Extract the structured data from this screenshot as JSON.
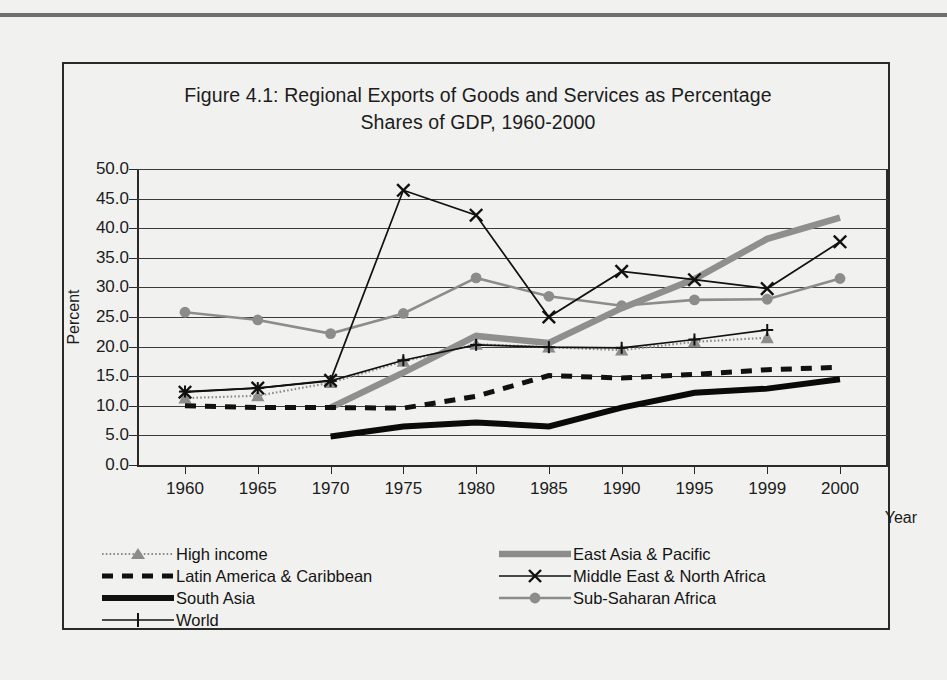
{
  "chart_data": {
    "type": "line",
    "title": "Figure 4.1: Regional Exports of Goods and Services as Percentage Shares of GDP, 1960-2000",
    "title_line1": "Figure 4.1: Regional Exports of Goods and Services as Percentage",
    "title_line2": "Shares of GDP, 1960-2000",
    "xlabel": "Year",
    "ylabel": "Percent",
    "ylim": [
      0.0,
      50.0
    ],
    "ytick_step": 5.0,
    "ytick_labels": [
      "50.0",
      "45.0",
      "40.0",
      "35.0",
      "30.0",
      "25.0",
      "20.0",
      "15.0",
      "10.0",
      "5.0",
      "0.0"
    ],
    "grid": true,
    "legend_position": "bottom",
    "categories": [
      "1960",
      "1965",
      "1970",
      "1975",
      "1980",
      "1985",
      "1990",
      "1995",
      "1999",
      "2000"
    ],
    "series": [
      {
        "name": "High income",
        "style": "dotted-gray-triangle",
        "color": "#8c8c8c",
        "marker": "triangle",
        "values": [
          11.3,
          11.7,
          13.9,
          17.5,
          20.4,
          19.9,
          19.4,
          20.8,
          21.5,
          null
        ]
      },
      {
        "name": "East Asia & Pacific",
        "style": "thick-gray",
        "color": "#8f8f8f",
        "marker": "none",
        "values": [
          null,
          null,
          9.7,
          15.6,
          21.8,
          20.6,
          26.5,
          31.4,
          38.2,
          41.8
        ]
      },
      {
        "name": "Latin America & Caribbean",
        "style": "thick-dashed-black",
        "color": "#111111",
        "marker": "none",
        "values": [
          10.0,
          9.7,
          9.7,
          9.6,
          11.6,
          15.1,
          14.7,
          15.3,
          16.1,
          16.5
        ]
      },
      {
        "name": "Middle East & North Africa",
        "style": "thin-black-x",
        "color": "#111111",
        "marker": "x",
        "values": [
          12.3,
          13.0,
          14.3,
          46.4,
          42.2,
          25.0,
          32.7,
          31.3,
          29.8,
          37.7
        ]
      },
      {
        "name": "South Asia",
        "style": "very-thick-black",
        "color": "#0a0a0a",
        "marker": "none",
        "values": [
          null,
          null,
          4.8,
          6.5,
          7.2,
          6.5,
          9.7,
          12.2,
          12.9,
          14.5
        ]
      },
      {
        "name": "Sub-Saharan Africa",
        "style": "medium-gray-circle",
        "color": "#8c8c8c",
        "marker": "circle",
        "values": [
          25.8,
          24.5,
          22.2,
          25.6,
          31.6,
          28.5,
          26.9,
          27.9,
          28.0,
          31.5
        ]
      },
      {
        "name": "World",
        "style": "thin-black-plus",
        "color": "#111111",
        "marker": "plus",
        "values": [
          12.4,
          13.0,
          14.2,
          17.7,
          20.3,
          19.9,
          19.8,
          21.2,
          22.8,
          null
        ]
      }
    ]
  },
  "legend": {
    "left_column": [
      {
        "label": "High income",
        "swatch": "dotted-gray-triangle"
      },
      {
        "label": "Latin America & Caribbean",
        "swatch": "thick-dashed-black"
      },
      {
        "label": "South Asia",
        "swatch": "very-thick-black"
      },
      {
        "label": "World",
        "swatch": "thin-black-plus"
      }
    ],
    "right_column": [
      {
        "label": "East Asia & Pacific",
        "swatch": "thick-gray"
      },
      {
        "label": "Middle East & North Africa",
        "swatch": "thin-black-x"
      },
      {
        "label": "Sub-Saharan Africa",
        "swatch": "medium-gray-circle"
      }
    ]
  },
  "colors": {
    "gray_series": "#8c8c8c",
    "black_series": "#111111",
    "gridline": "#3a3a3a",
    "frame": "#2a2a2a",
    "page_background": "#f1f1ef"
  }
}
